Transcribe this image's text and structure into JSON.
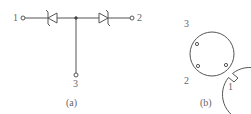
{
  "panel_a": {
    "caption": "(a)",
    "pins": [
      {
        "label": "1"
      },
      {
        "label": "2"
      },
      {
        "label": "3"
      }
    ],
    "components": [
      "tvs-diode-left",
      "tvs-diode-right"
    ]
  },
  "panel_b": {
    "caption": "(b)",
    "pins": [
      {
        "label": "3"
      },
      {
        "label": "2"
      },
      {
        "label": "1"
      }
    ]
  },
  "colors": {
    "stroke": "#555555",
    "text": "#666666"
  }
}
